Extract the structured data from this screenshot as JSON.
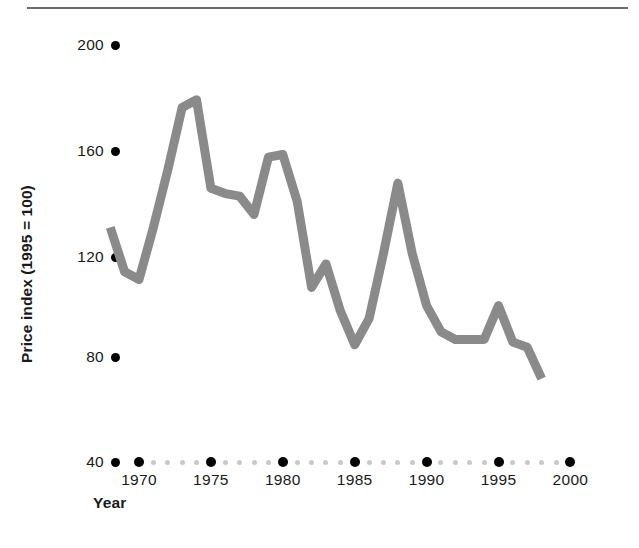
{
  "chart_data": {
    "type": "line",
    "title": "",
    "xlabel": "Year",
    "ylabel": "Price index (1995 = 100)",
    "xlim": [
      1968,
      2000
    ],
    "ylim": [
      40,
      200
    ],
    "grid": false,
    "legend": "none",
    "line_color": "#8a8a8a",
    "tick_color": "#000000",
    "minor_tick_color": "#c9c9c9",
    "yticks": [
      40,
      80,
      120,
      160,
      200
    ],
    "xticks": [
      1970,
      1975,
      1980,
      1985,
      1990,
      1995,
      2000
    ],
    "x_minor_ticks": [
      1971,
      1972,
      1973,
      1974,
      1976,
      1977,
      1978,
      1979,
      1981,
      1982,
      1983,
      1984,
      1986,
      1987,
      1988,
      1989,
      1991,
      1992,
      1993,
      1994,
      1996,
      1997,
      1998,
      1999
    ],
    "x": [
      1968,
      1969,
      1970,
      1971,
      1972,
      1973,
      1974,
      1975,
      1976,
      1977,
      1978,
      1979,
      1980,
      1981,
      1982,
      1983,
      1984,
      1985,
      1986,
      1987,
      1988,
      1989,
      1990,
      1991,
      1992,
      1993,
      1994,
      1995,
      1996,
      1997,
      1998
    ],
    "values": [
      130,
      113,
      110,
      130,
      152,
      176,
      179,
      145,
      143,
      142,
      135,
      157,
      158,
      140,
      107,
      116,
      98,
      85,
      95,
      120,
      147,
      120,
      100,
      90,
      87,
      87,
      87,
      100,
      86,
      84,
      72
    ],
    "series": [
      {
        "name": "Price index",
        "values": [
          130,
          113,
          110,
          130,
          152,
          176,
          179,
          145,
          143,
          142,
          135,
          157,
          158,
          140,
          107,
          116,
          98,
          85,
          95,
          120,
          147,
          120,
          100,
          90,
          87,
          87,
          87,
          100,
          86,
          84,
          72
        ]
      }
    ]
  },
  "axes": {
    "y": {
      "label": "Price index (1995 = 100)",
      "tick_labels": [
        "200",
        "160",
        "120",
        "80",
        "40"
      ]
    },
    "x": {
      "label": "Year",
      "tick_labels": [
        "1970",
        "1975",
        "1980",
        "1985",
        "1990",
        "1995",
        "2000"
      ]
    }
  }
}
